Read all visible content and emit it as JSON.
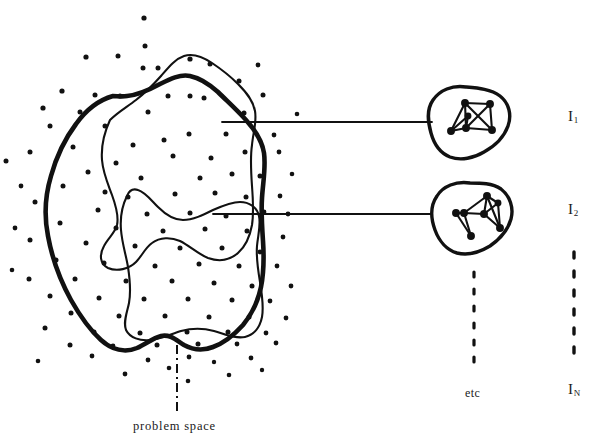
{
  "figure": {
    "caption": {
      "text": "problem space",
      "leader_style": "dash-dot"
    },
    "problem_space": {
      "name": "problem space",
      "outline_style": "thick hand-drawn closed blob",
      "stroke_color": "#111111",
      "dot_color": "#111111",
      "dot_count_label": "scattered instance dots",
      "inner_regions": [
        {
          "name": "upper-subregion",
          "outline_style": "thin hand-drawn contour"
        },
        {
          "name": "lower-subregion",
          "outline_style": "thin hand-drawn contour"
        }
      ]
    },
    "instances": [
      {
        "id": "instance-1",
        "label": "I",
        "subscript": "1",
        "blob_name": "instance-blob-1",
        "graph_name": "instance-graph-1",
        "connector_name": "connector-line-1"
      },
      {
        "id": "instance-2",
        "label": "I",
        "subscript": "2",
        "blob_name": "instance-blob-2",
        "graph_name": "instance-graph-2",
        "connector_name": "connector-line-2"
      }
    ],
    "continuation": {
      "etc_label": "etc",
      "last_label": "I",
      "last_subscript": "N",
      "dots_style": "vertical dashed"
    },
    "colors": {
      "ink": "#111111",
      "background": "#ffffff"
    }
  }
}
